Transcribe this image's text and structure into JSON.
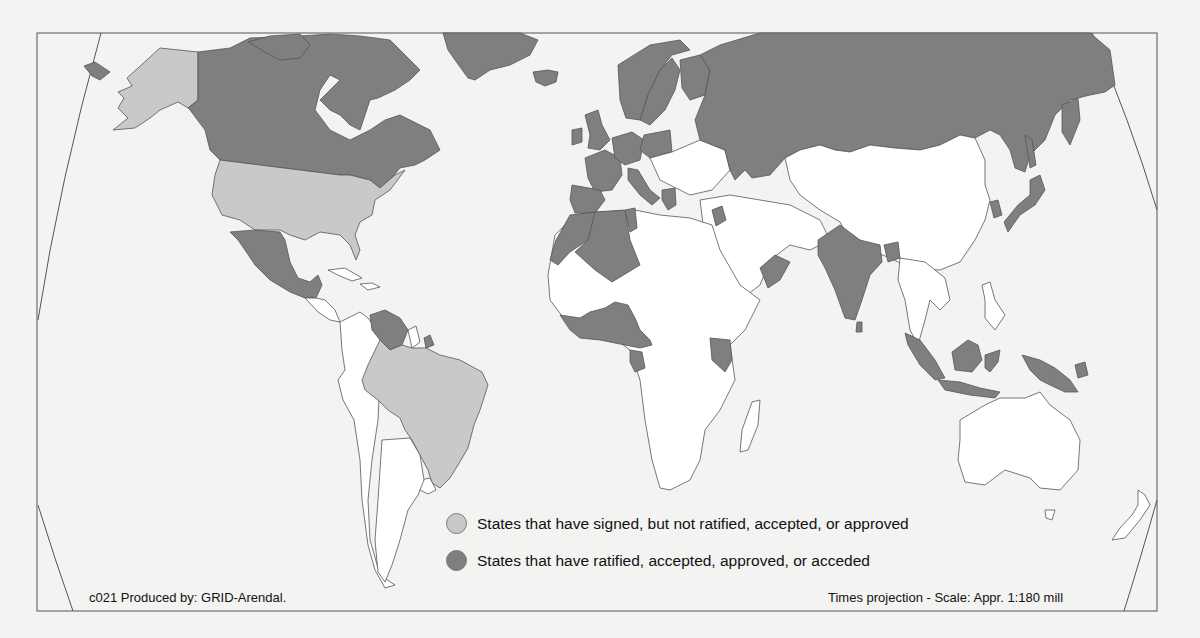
{
  "map": {
    "projection": "Times projection - Scale: Appr. 1:180 mill",
    "credit": "c021 Produced by: GRID-Arendal.",
    "colors": {
      "signed": "#c9c9c9",
      "ratified": "#7f7f7f",
      "none": "#ffffff",
      "outline": "#555555",
      "background": "#f3f3f2"
    },
    "legend": [
      {
        "key": "signed",
        "label": "States that have signed, but not ratified, accepted, or approved",
        "color": "#c9c9c9"
      },
      {
        "key": "ratified",
        "label": "States that have ratified, accepted, approved, or acceded",
        "color": "#7f7f7f"
      }
    ],
    "signed_states": [
      "United States",
      "Brazil"
    ],
    "ratified_states_visible": [
      "Canada",
      "Greenland",
      "Iceland",
      "Russia",
      "Norway",
      "Sweden",
      "Finland",
      "United Kingdom",
      "Ireland",
      "France",
      "Germany",
      "Spain",
      "Portugal",
      "Italy",
      "Greece",
      "Morocco",
      "Algeria",
      "Tunisia",
      "Mexico",
      "Venezuela",
      "Nigeria",
      "Ghana",
      "Côte d'Ivoire",
      "Gabon",
      "Cameroon",
      "Kenya",
      "Oman",
      "India",
      "Sri Lanka",
      "Bangladesh",
      "Japan",
      "South Korea",
      "Indonesia",
      "Papua New Guinea",
      "Malaysia",
      "Israel",
      "Uruguay",
      "Suriname"
    ]
  }
}
